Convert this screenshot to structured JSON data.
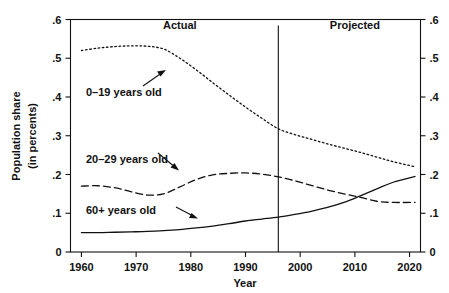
{
  "chart_data": {
    "type": "line",
    "title": "",
    "xlabel": "Year",
    "ylabel": "Population share (in percents)",
    "ylabel_line1": "Population share",
    "ylabel_line2": "(in percents)",
    "xlim": [
      1958,
      2022
    ],
    "ylim": [
      0,
      0.6
    ],
    "grid": false,
    "legend_position": "inline-annotations",
    "x_ticks": [
      1960,
      1970,
      1980,
      1990,
      2000,
      2010,
      2020
    ],
    "x_tick_labels": [
      "1960",
      "1970",
      "1980",
      "1990",
      "2000",
      "2010",
      "2020"
    ],
    "y_ticks": [
      0,
      0.1,
      0.2,
      0.3,
      0.4,
      0.5,
      0.6
    ],
    "y_tick_labels": [
      "0",
      ".1",
      ".2",
      ".3",
      ".4",
      ".5",
      ".6"
    ],
    "y_ticks_right": [
      0,
      0.1,
      0.2,
      0.3,
      0.4,
      0.5,
      0.6
    ],
    "y_tick_labels_right": [
      "0",
      ".1",
      ".2",
      ".3",
      ".4",
      ".5",
      ".6"
    ],
    "annotations": [
      {
        "text": "Actual",
        "x": 1978,
        "y": 0.575
      },
      {
        "text": "Projected",
        "x": 2010,
        "y": 0.575
      }
    ],
    "divider": {
      "x": 1996,
      "label": "actual-projected-boundary"
    },
    "series": [
      {
        "name": "0–19 years old",
        "label": "0–19 years old",
        "style": "dotted",
        "x": [
          1960,
          1963,
          1966,
          1969,
          1972,
          1975,
          1978,
          1981,
          1984,
          1987,
          1990,
          1993,
          1996,
          1999,
          2002,
          2005,
          2008,
          2011,
          2014,
          2017,
          2021
        ],
        "values": [
          0.52,
          0.526,
          0.53,
          0.532,
          0.531,
          0.524,
          0.5,
          0.47,
          0.437,
          0.405,
          0.374,
          0.345,
          0.318,
          0.303,
          0.291,
          0.279,
          0.268,
          0.257,
          0.245,
          0.233,
          0.22
        ]
      },
      {
        "name": "20–29 years old",
        "label": "20–29 years old",
        "style": "dashed",
        "x": [
          1960,
          1963,
          1966,
          1969,
          1972,
          1975,
          1978,
          1981,
          1984,
          1987,
          1990,
          1993,
          1996,
          1999,
          2002,
          2005,
          2008,
          2011,
          2014,
          2017,
          2021
        ],
        "values": [
          0.17,
          0.171,
          0.166,
          0.156,
          0.147,
          0.15,
          0.168,
          0.187,
          0.199,
          0.203,
          0.204,
          0.201,
          0.194,
          0.184,
          0.172,
          0.16,
          0.15,
          0.141,
          0.131,
          0.128,
          0.128
        ]
      },
      {
        "name": "60+ years old",
        "label": "60+  years old",
        "style": "solid",
        "x": [
          1960,
          1963,
          1966,
          1969,
          1972,
          1975,
          1978,
          1981,
          1984,
          1987,
          1990,
          1993,
          1996,
          1999,
          2002,
          2005,
          2008,
          2011,
          2014,
          2017,
          2021
        ],
        "values": [
          0.05,
          0.05,
          0.051,
          0.052,
          0.053,
          0.055,
          0.058,
          0.062,
          0.067,
          0.073,
          0.08,
          0.085,
          0.09,
          0.097,
          0.105,
          0.115,
          0.128,
          0.145,
          0.163,
          0.18,
          0.195
        ]
      }
    ]
  },
  "colors": {
    "ink": "#111111",
    "background": "#ffffff"
  }
}
